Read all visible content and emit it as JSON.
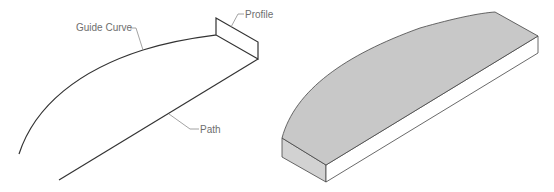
{
  "left_diagram": {
    "labels": {
      "guide_curve": "Guide Curve",
      "profile": "Profile",
      "path": "Path"
    },
    "line_color": "#333333",
    "leader_color": "#8c8c8c"
  },
  "right_diagram": {
    "description": "Swept solid result",
    "top_face_color": "#c8c8c8",
    "side_face_color": "#ffffff",
    "left_face_color": "#d2d2d2"
  }
}
